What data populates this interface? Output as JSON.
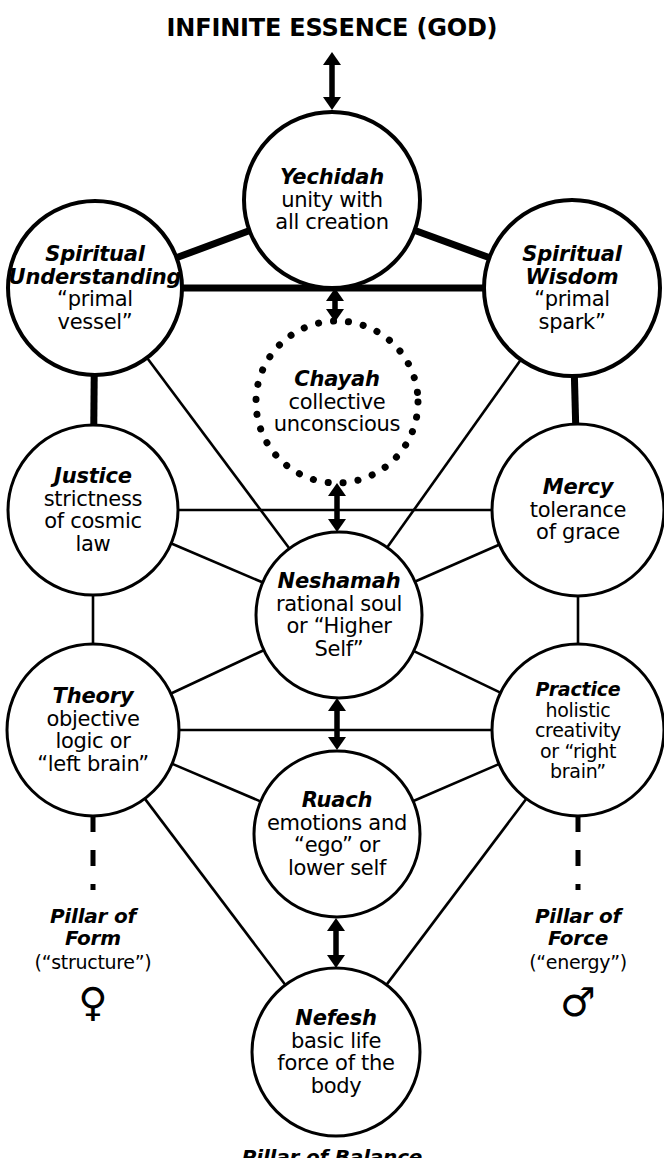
{
  "diagram": {
    "title": "INFINITE ESSENCE (GOD)",
    "bottom_caption": "Pillar of Balance",
    "colors": {
      "ink": "#000000",
      "background": "#ffffff"
    },
    "nodes": [
      {
        "id": "yechidah",
        "title": "Yechidah",
        "line1": "unity with",
        "line2": "all creation",
        "line3": "",
        "cx": 332,
        "cy": 200,
        "r": 88,
        "stroke": 4,
        "style": "solid"
      },
      {
        "id": "spiritual-understanding",
        "title": "Spiritual",
        "title2": "Understanding",
        "line1": "“primal",
        "line2": "vessel”",
        "line3": "",
        "cx": 95,
        "cy": 288,
        "r": 87,
        "stroke": 4,
        "style": "solid"
      },
      {
        "id": "spiritual-wisdom",
        "title": "Spiritual",
        "title2": "Wisdom",
        "line1": "“primal",
        "line2": "spark”",
        "line3": "",
        "cx": 572,
        "cy": 288,
        "r": 88,
        "stroke": 4,
        "style": "solid"
      },
      {
        "id": "chayah",
        "title": "Chayah",
        "line1": "collective",
        "line2": "unconscious",
        "line3": "",
        "cx": 337,
        "cy": 402,
        "r": 81,
        "stroke": 5,
        "style": "dotted"
      },
      {
        "id": "justice",
        "title": "Justice",
        "line1": "strictness",
        "line2": "of cosmic",
        "line3": "law",
        "cx": 93,
        "cy": 510,
        "r": 85,
        "stroke": 3,
        "style": "solid"
      },
      {
        "id": "mercy",
        "title": "Mercy",
        "line1": "tolerance",
        "line2": "of grace",
        "line3": "",
        "cx": 578,
        "cy": 510,
        "r": 86,
        "stroke": 3,
        "style": "solid"
      },
      {
        "id": "neshamah",
        "title": "Neshamah",
        "line1": "rational soul",
        "line2": "or “Higher",
        "line3": "Self”",
        "cx": 339,
        "cy": 615,
        "r": 83,
        "stroke": 3,
        "style": "solid"
      },
      {
        "id": "theory",
        "title": "Theory",
        "line1": "objective",
        "line2": "logic or",
        "line3": "“left brain”",
        "cx": 93,
        "cy": 730,
        "r": 86,
        "stroke": 3,
        "style": "solid"
      },
      {
        "id": "practice",
        "title": "Practice",
        "line1": "holistic",
        "line2": "creativity",
        "line3": "or “right",
        "line4": "brain”",
        "cx": 578,
        "cy": 730,
        "r": 86,
        "stroke": 3,
        "style": "solid"
      },
      {
        "id": "ruach",
        "title": "Ruach",
        "line1": "emotions and",
        "line2": "“ego” or",
        "line3": "lower self",
        "cx": 337,
        "cy": 834,
        "r": 83,
        "stroke": 3,
        "style": "solid"
      },
      {
        "id": "nefesh",
        "title": "Nefesh",
        "line1": "basic life",
        "line2": "force of the",
        "line3": "body",
        "cx": 336,
        "cy": 1052,
        "r": 84,
        "stroke": 3,
        "style": "solid"
      }
    ],
    "pillars": [
      {
        "id": "pillar-of-form",
        "name_line1": "Pillar of",
        "name_line2": "Form",
        "subtitle": "(“structure”)",
        "symbol": "♀",
        "symbol_name": "venus-female-symbol",
        "x": 93,
        "y": 905,
        "symbol_y": 1002
      },
      {
        "id": "pillar-of-force",
        "name_line1": "Pillar of",
        "name_line2": "Force",
        "subtitle": "(“energy”)",
        "symbol": "♂",
        "symbol_name": "mars-male-symbol",
        "x": 578,
        "y": 905,
        "symbol_y": 1002
      }
    ],
    "connectors": {
      "thick_edges": [
        {
          "from": "yechidah",
          "to": "spiritual-understanding"
        },
        {
          "from": "yechidah",
          "to": "spiritual-wisdom"
        },
        {
          "from": "spiritual-understanding",
          "to": "spiritual-wisdom"
        },
        {
          "from": "spiritual-understanding",
          "to": "justice"
        },
        {
          "from": "spiritual-wisdom",
          "to": "mercy"
        }
      ],
      "thin_edges": [
        {
          "from": "spiritual-understanding",
          "to": "neshamah"
        },
        {
          "from": "spiritual-wisdom",
          "to": "neshamah"
        },
        {
          "from": "justice",
          "to": "mercy"
        },
        {
          "from": "justice",
          "to": "neshamah"
        },
        {
          "from": "mercy",
          "to": "neshamah"
        },
        {
          "from": "justice",
          "to": "theory"
        },
        {
          "from": "mercy",
          "to": "practice"
        },
        {
          "from": "theory",
          "to": "neshamah"
        },
        {
          "from": "practice",
          "to": "neshamah"
        },
        {
          "from": "theory",
          "to": "practice"
        },
        {
          "from": "theory",
          "to": "ruach"
        },
        {
          "from": "practice",
          "to": "ruach"
        },
        {
          "from": "theory",
          "to": "nefesh"
        },
        {
          "from": "practice",
          "to": "nefesh"
        }
      ],
      "double_arrows": [
        {
          "label": "infinite-essence-to-yechidah",
          "x": 332,
          "y_top": 52,
          "y_bottom": 110
        },
        {
          "label": "yechidah-to-chayah",
          "x": 335,
          "y_top": 288,
          "y_bottom": 322
        },
        {
          "label": "chayah-to-neshamah",
          "x": 337,
          "y_top": 483,
          "y_bottom": 532
        },
        {
          "label": "neshamah-to-ruach",
          "x": 337,
          "y_top": 698,
          "y_bottom": 750
        },
        {
          "label": "ruach-to-nefesh",
          "x": 336,
          "y_top": 918,
          "y_bottom": 968
        }
      ],
      "dashed_verticals": [
        {
          "label": "theory-down-dashed",
          "x": 93,
          "y_top": 816,
          "y_bottom": 890
        },
        {
          "label": "practice-down-dashed",
          "x": 578,
          "y_top": 816,
          "y_bottom": 890
        }
      ]
    }
  }
}
